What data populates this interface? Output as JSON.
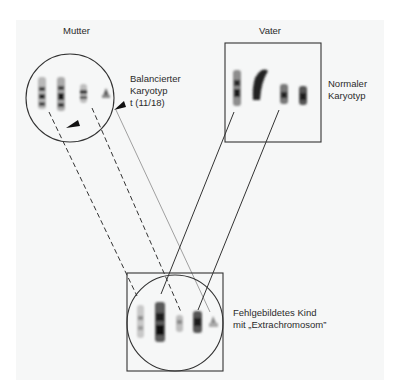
{
  "mother": {
    "title": "Mutter",
    "annotation_lines": [
      "Balancierter",
      "Karyotyp",
      "t (11/18)"
    ]
  },
  "father": {
    "title": "Vater",
    "annotation_lines": [
      "Normaler",
      "Karyotyp"
    ]
  },
  "child": {
    "annotation_lines": [
      "Fehlgebildetes Kind",
      "mit „Extrachromosom”"
    ]
  },
  "colors": {
    "line": "#333333",
    "faint_line": "#9a9a9a",
    "chromosome_dark": "#222222",
    "background": "#f6f7f7"
  },
  "icons": [
    "chromosome-icon",
    "arrow-pointer-icon"
  ]
}
